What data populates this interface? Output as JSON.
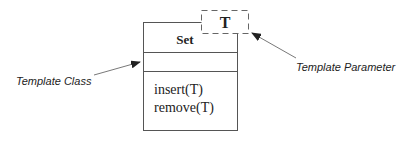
{
  "diagram": {
    "class_box": {
      "name": "Set",
      "attributes": [],
      "operations": [
        "insert(T)",
        "remove(T)"
      ]
    },
    "template_parameter": {
      "label": "T"
    },
    "annotations": {
      "template_class": "Template Class",
      "template_parameter": "Template Parameter"
    },
    "colors": {
      "line": "#555555",
      "text": "#222222",
      "background": "#ffffff"
    }
  }
}
